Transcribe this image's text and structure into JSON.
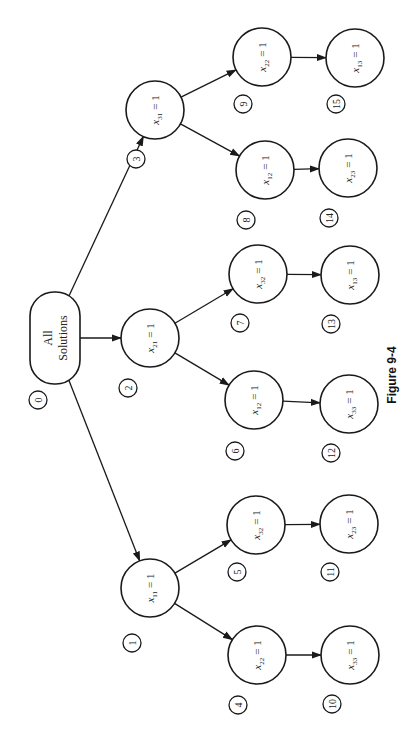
{
  "diagram": {
    "root": {
      "id": 0,
      "line1": "All",
      "line2": "Solutions",
      "x": 55,
      "y": 338
    },
    "nodes": [
      {
        "id": 1,
        "var": "x",
        "sub": "11",
        "eq": "= 1",
        "x": 150,
        "y": 588,
        "nx": 132,
        "ny": 643
      },
      {
        "id": 2,
        "var": "x",
        "sub": "21",
        "eq": "= 1",
        "x": 150,
        "y": 338,
        "nx": 128,
        "ny": 388
      },
      {
        "id": 3,
        "var": "x",
        "sub": "31",
        "eq": "= 1",
        "x": 155,
        "y": 110,
        "nx": 136,
        "ny": 159
      },
      {
        "id": 4,
        "var": "x",
        "sub": "22",
        "eq": "= 1",
        "x": 257,
        "y": 655,
        "nx": 238,
        "ny": 705
      },
      {
        "id": 5,
        "var": "x",
        "sub": "32",
        "eq": "= 1",
        "x": 256,
        "y": 525,
        "nx": 237,
        "ny": 572
      },
      {
        "id": 6,
        "var": "x",
        "sub": "12",
        "eq": "= 1",
        "x": 254,
        "y": 400,
        "nx": 235,
        "ny": 451
      },
      {
        "id": 7,
        "var": "x",
        "sub": "32",
        "eq": "= 1",
        "x": 258,
        "y": 274,
        "nx": 240,
        "ny": 323
      },
      {
        "id": 8,
        "var": "x",
        "sub": "12",
        "eq": "= 1",
        "x": 265,
        "y": 170,
        "nx": 246,
        "ny": 220
      },
      {
        "id": 9,
        "var": "x",
        "sub": "22",
        "eq": "= 1",
        "x": 262,
        "y": 57,
        "nx": 243,
        "ny": 104
      },
      {
        "id": 10,
        "var": "x",
        "sub": "33",
        "eq": "= 1",
        "x": 350,
        "y": 655,
        "nx": 332,
        "ny": 704
      },
      {
        "id": 11,
        "var": "x",
        "sub": "23",
        "eq": "= 1",
        "x": 349,
        "y": 524,
        "nx": 330,
        "ny": 572
      },
      {
        "id": 12,
        "var": "x",
        "sub": "33",
        "eq": "= 1",
        "x": 349,
        "y": 404,
        "nx": 331,
        "ny": 453
      },
      {
        "id": 13,
        "var": "x",
        "sub": "13",
        "eq": "= 1",
        "x": 350,
        "y": 275,
        "nx": 331,
        "ny": 324
      },
      {
        "id": 14,
        "var": "x",
        "sub": "23",
        "eq": "= 1",
        "x": 348,
        "y": 168,
        "nx": 329,
        "ny": 218
      },
      {
        "id": 15,
        "var": "x",
        "sub": "13",
        "eq": "= 1",
        "x": 355,
        "y": 58,
        "nx": 336,
        "ny": 104
      }
    ],
    "root_number": {
      "label": "0",
      "x": 38,
      "y": 400
    },
    "edges": [
      [
        0,
        1
      ],
      [
        0,
        2
      ],
      [
        0,
        3
      ],
      [
        1,
        4
      ],
      [
        1,
        5
      ],
      [
        2,
        6
      ],
      [
        2,
        7
      ],
      [
        3,
        8
      ],
      [
        3,
        9
      ],
      [
        4,
        10
      ],
      [
        5,
        11
      ],
      [
        6,
        12
      ],
      [
        7,
        13
      ],
      [
        8,
        14
      ],
      [
        9,
        15
      ]
    ]
  },
  "caption": {
    "text": "Figure 9-4",
    "x": 392,
    "y": 375
  }
}
